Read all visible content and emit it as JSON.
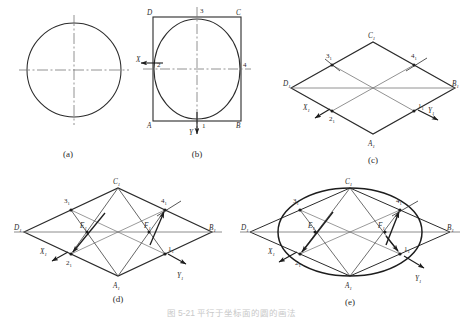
{
  "figure": {
    "title_caption": "图 5-21 平行于坐标面的圆的画法",
    "panels": [
      {
        "id": "a",
        "caption": "(a)",
        "description": "circle-with-centerlines",
        "elements": {
          "shape": "circle",
          "centerlines": [
            "horizontal",
            "vertical"
          ]
        }
      },
      {
        "id": "b",
        "caption": "(b)",
        "description": "square-with-inscribed-circle",
        "corner_labels": [
          "A",
          "B",
          "C",
          "D"
        ],
        "tangent_point_labels": [
          "1",
          "2",
          "3",
          "4"
        ],
        "axis_labels": [
          "X",
          "Y"
        ],
        "axis_arrows": {
          "X": "left",
          "Y": "down"
        }
      },
      {
        "id": "c",
        "caption": "(c)",
        "description": "isometric-rhombus-with-midpoints",
        "corner_labels": [
          "A",
          "B",
          "C",
          "D"
        ],
        "corner_subscript": "1",
        "midpoint_labels": [
          "1",
          "2",
          "3",
          "4"
        ],
        "midpoint_subscript": "1",
        "axis_labels": [
          "X",
          "Y"
        ],
        "axis_subscript": "1"
      },
      {
        "id": "d",
        "caption": "(d)",
        "description": "rhombus-with-construction-lines",
        "corner_labels": [
          "A",
          "B",
          "C",
          "D"
        ],
        "corner_subscript": "1",
        "midpoint_labels": [
          "1",
          "2",
          "3",
          "4"
        ],
        "midpoint_subscript": "1",
        "center_labels": [
          "E",
          "F"
        ],
        "center_subscript": "1",
        "axis_labels": [
          "X",
          "Y"
        ],
        "axis_subscript": "1"
      },
      {
        "id": "e",
        "caption": "(e)",
        "description": "completed-four-arc-ellipse-in-rhombus",
        "corner_labels": [
          "A",
          "B",
          "C",
          "D"
        ],
        "corner_subscript": "1",
        "midpoint_labels": [
          "1",
          "2",
          "3",
          "4"
        ],
        "midpoint_subscript": "1",
        "center_labels": [
          "E",
          "F"
        ],
        "center_subscript": "1",
        "axis_labels": [
          "X",
          "Y"
        ],
        "axis_subscript": "1"
      }
    ],
    "colors": {
      "line": "#2b2b2b",
      "thin_line": "#555555",
      "centerline": "#777777",
      "background": "#ffffff"
    }
  }
}
